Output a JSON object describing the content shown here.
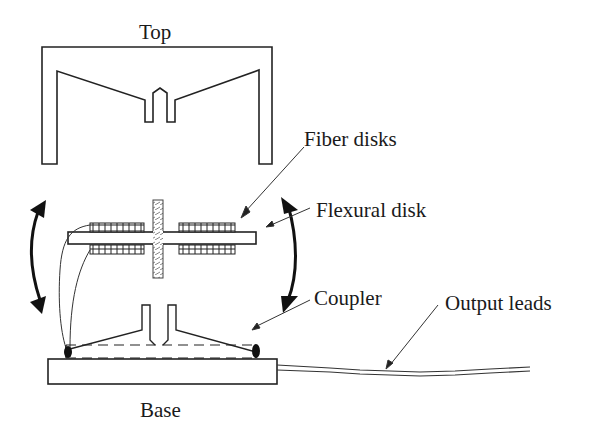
{
  "diagram": {
    "labels": {
      "top": "Top",
      "fiber_disks": "Fiber disks",
      "flexural_disk": "Flexural disk",
      "coupler": "Coupler",
      "output_leads": "Output leads",
      "base": "Base"
    },
    "colors": {
      "line": "#222222",
      "background": "#ffffff"
    }
  }
}
